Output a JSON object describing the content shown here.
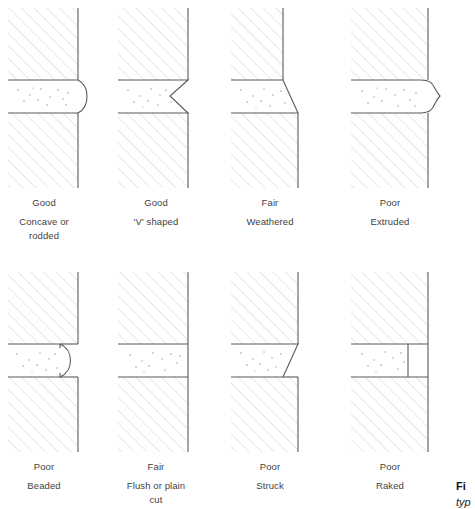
{
  "figure": {
    "colors": {
      "hatch": "#cfcfcf",
      "outline": "#5a5a5a",
      "stipple": "#8a8a8a",
      "text": "#3f3f3f",
      "background": "#ffffff"
    },
    "panels": [
      {
        "id": "concave",
        "rating": "Good",
        "name": "Concave or rodded",
        "name_lines": [
          "Concave or",
          "rodded"
        ],
        "profile": "concave"
      },
      {
        "id": "vshaped",
        "rating": "Good",
        "name": "'V' shaped",
        "name_lines": [
          "'V' shaped"
        ],
        "profile": "vee"
      },
      {
        "id": "weathered",
        "rating": "Fair",
        "name": "Weathered",
        "name_lines": [
          "Weathered"
        ],
        "profile": "weathered"
      },
      {
        "id": "extruded",
        "rating": "Poor",
        "name": "Extruded",
        "name_lines": [
          "Extruded"
        ],
        "profile": "extruded"
      },
      {
        "id": "beaded",
        "rating": "Poor",
        "name": "Beaded",
        "name_lines": [
          "Beaded"
        ],
        "profile": "beaded"
      },
      {
        "id": "flush",
        "rating": "Fair",
        "name": "Flush or plain cut",
        "name_lines": [
          "Flush or plain",
          "cut"
        ],
        "profile": "flush"
      },
      {
        "id": "struck",
        "rating": "Poor",
        "name": "Struck",
        "name_lines": [
          "Struck"
        ],
        "profile": "struck"
      },
      {
        "id": "raked",
        "rating": "Poor",
        "name": "Raked",
        "name_lines": [
          "Raked"
        ],
        "profile": "raked"
      }
    ],
    "caption": {
      "label": "Fi",
      "text": "typ"
    }
  }
}
